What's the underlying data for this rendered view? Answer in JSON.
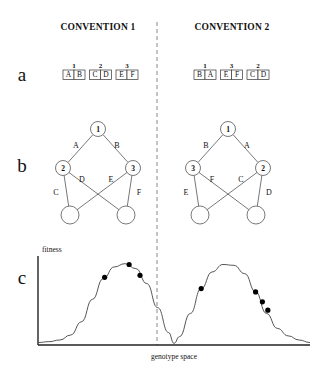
{
  "figure": {
    "headers": [
      {
        "label": "CONVENTION 1",
        "x": 98
      },
      {
        "label": "CONVENTION 2",
        "x": 232
      }
    ],
    "panel_letters": [
      {
        "label": "a",
        "x": 22,
        "y": 81
      },
      {
        "label": "b",
        "x": 22,
        "y": 172
      },
      {
        "label": "c",
        "x": 22,
        "y": 284
      }
    ],
    "divider": {
      "x": 157,
      "y_top": 22,
      "y_bottom": 345
    },
    "panel_a": {
      "genomes": [
        {
          "name": "convention-1-genome",
          "origin_x": 63,
          "boxes": [
            {
              "number": "1",
              "left": "A",
              "right": "B"
            },
            {
              "number": "2",
              "left": "C",
              "right": "D"
            },
            {
              "number": "3",
              "left": "E",
              "right": "F"
            }
          ]
        },
        {
          "name": "convention-2-genome",
          "origin_x": 194,
          "boxes": [
            {
              "number": "1",
              "left": "B",
              "right": "A"
            },
            {
              "number": "3",
              "left": "E",
              "right": "F"
            },
            {
              "number": "2",
              "left": "C",
              "right": "D"
            }
          ]
        }
      ]
    },
    "panel_b": {
      "networks": [
        {
          "name": "convention-1-network",
          "nodes": [
            {
              "id": "top",
              "label": "1",
              "x": 98,
              "y": 129,
              "r": 7.5
            },
            {
              "id": "mid-left",
              "label": "2",
              "x": 63,
              "y": 168,
              "r": 7.5
            },
            {
              "id": "mid-right",
              "label": "3",
              "x": 133,
              "y": 168,
              "r": 7.5
            },
            {
              "id": "bottom-left",
              "label": "",
              "x": 70,
              "y": 215,
              "r": 9
            },
            {
              "id": "bottom-right",
              "label": "",
              "x": 126,
              "y": 215,
              "r": 9
            }
          ],
          "edges": [
            {
              "label": "A",
              "from": "top",
              "to": "mid-left",
              "lx": 76,
              "ly": 148
            },
            {
              "label": "B",
              "from": "top",
              "to": "mid-right",
              "lx": 117,
              "ly": 148
            },
            {
              "label": "C",
              "from": "mid-left",
              "to": "bottom-left",
              "lx": 56,
              "ly": 195
            },
            {
              "label": "D",
              "from": "mid-left",
              "to": "bottom-right",
              "lx": 82,
              "ly": 182
            },
            {
              "label": "E",
              "from": "mid-right",
              "to": "bottom-left",
              "lx": 111,
              "ly": 182
            },
            {
              "label": "F",
              "from": "mid-right",
              "to": "bottom-right",
              "lx": 139,
              "ly": 195
            }
          ]
        },
        {
          "name": "convention-2-network",
          "nodes": [
            {
              "id": "top",
              "label": "1",
              "x": 228,
              "y": 129,
              "r": 7.5
            },
            {
              "id": "mid-left",
              "label": "3",
              "x": 193,
              "y": 168,
              "r": 7.5
            },
            {
              "id": "mid-right",
              "label": "2",
              "x": 263,
              "y": 168,
              "r": 7.5
            },
            {
              "id": "bottom-left",
              "label": "",
              "x": 200,
              "y": 215,
              "r": 9
            },
            {
              "id": "bottom-right",
              "label": "",
              "x": 256,
              "y": 215,
              "r": 9
            }
          ],
          "edges": [
            {
              "label": "B",
              "from": "top",
              "to": "mid-left",
              "lx": 206,
              "ly": 148
            },
            {
              "label": "A",
              "from": "top",
              "to": "mid-right",
              "lx": 247,
              "ly": 148
            },
            {
              "label": "E",
              "from": "mid-left",
              "to": "bottom-left",
              "lx": 186,
              "ly": 195
            },
            {
              "label": "F",
              "from": "mid-left",
              "to": "bottom-right",
              "lx": 212,
              "ly": 182
            },
            {
              "label": "C",
              "from": "mid-right",
              "to": "bottom-left",
              "lx": 241,
              "ly": 182
            },
            {
              "label": "D",
              "from": "mid-right",
              "to": "bottom-right",
              "lx": 269,
              "ly": 195
            }
          ]
        }
      ]
    },
    "panel_c": {
      "y_axis_label": "fitness",
      "x_axis_label": "genotype space"
    }
  },
  "chart_data": {
    "type": "line",
    "title": "",
    "xlabel": "genotype space",
    "ylabel": "fitness",
    "xlim": [
      0,
      1
    ],
    "ylim": [
      0,
      1
    ],
    "grid": false,
    "legend": "none",
    "series": [
      {
        "name": "fitness-landscape",
        "x": [
          0.0,
          0.04,
          0.08,
          0.12,
          0.16,
          0.2,
          0.24,
          0.28,
          0.32,
          0.36,
          0.4,
          0.44,
          0.48,
          0.5,
          0.52,
          0.56,
          0.6,
          0.64,
          0.68,
          0.72,
          0.76,
          0.8,
          0.84,
          0.88,
          0.92,
          0.96,
          1.0
        ],
        "y": [
          0.03,
          0.04,
          0.06,
          0.12,
          0.28,
          0.55,
          0.8,
          0.94,
          0.98,
          0.92,
          0.74,
          0.45,
          0.15,
          0.02,
          0.1,
          0.38,
          0.68,
          0.88,
          0.97,
          0.96,
          0.86,
          0.64,
          0.38,
          0.2,
          0.11,
          0.06,
          0.03
        ]
      }
    ],
    "points": [
      {
        "group": "left-peak",
        "x": 0.245,
        "y": 0.815
      },
      {
        "group": "left-peak",
        "x": 0.335,
        "y": 0.97
      },
      {
        "group": "left-peak",
        "x": 0.375,
        "y": 0.84
      },
      {
        "group": "right-peak",
        "x": 0.6,
        "y": 0.68
      },
      {
        "group": "right-peak",
        "x": 0.8,
        "y": 0.64
      },
      {
        "group": "right-peak",
        "x": 0.825,
        "y": 0.52
      },
      {
        "group": "right-peak",
        "x": 0.845,
        "y": 0.42
      }
    ],
    "axes": {
      "y_axis_x_px": 38,
      "baseline_y_px": 345,
      "plot_left_px": 38,
      "plot_right_px": 310,
      "plot_top_px": 262
    }
  }
}
